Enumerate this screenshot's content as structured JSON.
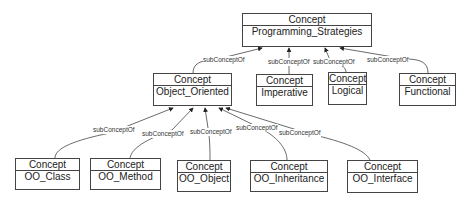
{
  "diagram": {
    "type_label": "Concept",
    "edge_label": "subConceptOf",
    "nodes": [
      {
        "id": "programming_strategies",
        "type": "Concept",
        "name": "Programming_Strategies"
      },
      {
        "id": "object_oriented",
        "type": "Concept",
        "name": "Object_Oriented"
      },
      {
        "id": "imperative",
        "type": "Concept",
        "name": "Imperative"
      },
      {
        "id": "logical",
        "type": "Concept",
        "name": "Logical"
      },
      {
        "id": "functional",
        "type": "Concept",
        "name": "Functional"
      },
      {
        "id": "oo_class",
        "type": "Concept",
        "name": "OO_Class"
      },
      {
        "id": "oo_method",
        "type": "Concept",
        "name": "OO_Method"
      },
      {
        "id": "oo_object",
        "type": "Concept",
        "name": "OO_Object"
      },
      {
        "id": "oo_inheritance",
        "type": "Concept",
        "name": "OO_Inheritance"
      },
      {
        "id": "oo_interface",
        "type": "Concept",
        "name": "OO_Interface"
      }
    ],
    "edges": [
      {
        "from": "object_oriented",
        "to": "programming_strategies",
        "label": "subConceptOf"
      },
      {
        "from": "imperative",
        "to": "programming_strategies",
        "label": "subConceptOf"
      },
      {
        "from": "logical",
        "to": "programming_strategies",
        "label": "subConceptOf"
      },
      {
        "from": "functional",
        "to": "programming_strategies",
        "label": "subConceptOf"
      },
      {
        "from": "oo_class",
        "to": "object_oriented",
        "label": "subConceptOf"
      },
      {
        "from": "oo_method",
        "to": "object_oriented",
        "label": "subConceptOf"
      },
      {
        "from": "oo_object",
        "to": "object_oriented",
        "label": "subConceptOf"
      },
      {
        "from": "oo_inheritance",
        "to": "object_oriented",
        "label": "subConceptOf"
      },
      {
        "from": "oo_interface",
        "to": "object_oriented",
        "label": "subConceptOf"
      }
    ]
  }
}
